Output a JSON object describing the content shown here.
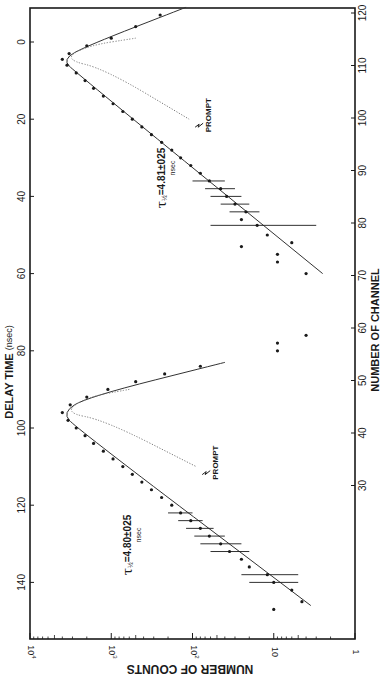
{
  "chart_data": {
    "type": "scatter",
    "orientation": "rotated-90-clockwise",
    "title": "",
    "left_axis": {
      "label": "DELAY TIME",
      "unit": "(nsec)",
      "ticks": [
        0,
        20,
        40,
        60,
        80,
        100,
        120,
        140
      ],
      "range": [
        -9,
        150
      ]
    },
    "right_axis": {
      "label": "NUMBER OF CHANNEL",
      "ticks": [
        30,
        40,
        50,
        60,
        70,
        80,
        90,
        100,
        110,
        120
      ],
      "range": [
        26,
        121
      ]
    },
    "bottom_axis": {
      "label": "NUMBER OF COUNTS",
      "scale": "log",
      "ticks": [
        "10^4",
        "10^3",
        "10^2",
        "10",
        "1"
      ],
      "tick_values": [
        10000,
        1000,
        100,
        10,
        1
      ],
      "range": [
        10000,
        1
      ]
    },
    "grid": false,
    "series": [
      {
        "name": "Spectrum 1 (channels ~80-120)",
        "annotation": "τ½ = 4.81 ± 0.25 nsec",
        "annotation_parts": {
          "symbol": "τ½=",
          "value": "4.81±025",
          "unit": "nsec"
        },
        "peak": {
          "delay_ns": 4.5,
          "counts": 4000
        },
        "points": [
          {
            "delay": -7,
            "counts": 250
          },
          {
            "delay": -4,
            "counts": 500
          },
          {
            "delay": -1,
            "counts": 1000
          },
          {
            "delay": 1,
            "counts": 2000
          },
          {
            "delay": 3,
            "counts": 3300
          },
          {
            "delay": 4.5,
            "counts": 4000
          },
          {
            "delay": 6,
            "counts": 3500
          },
          {
            "delay": 8,
            "counts": 2700
          },
          {
            "delay": 10,
            "counts": 2100
          },
          {
            "delay": 12,
            "counts": 1650
          },
          {
            "delay": 14,
            "counts": 1250
          },
          {
            "delay": 16,
            "counts": 950
          },
          {
            "delay": 18,
            "counts": 720
          },
          {
            "delay": 20,
            "counts": 550
          },
          {
            "delay": 22,
            "counts": 420
          },
          {
            "delay": 24,
            "counts": 320
          },
          {
            "delay": 26,
            "counts": 240
          },
          {
            "delay": 28,
            "counts": 180
          },
          {
            "delay": 30,
            "counts": 140
          },
          {
            "delay": 32,
            "counts": 105
          },
          {
            "delay": 34,
            "counts": 80
          },
          {
            "delay": 36,
            "counts": 62
          },
          {
            "delay": 38,
            "counts": 45
          },
          {
            "delay": 40,
            "counts": 38
          },
          {
            "delay": 42,
            "counts": 30
          },
          {
            "delay": 44,
            "counts": 22
          },
          {
            "delay": 46,
            "counts": 25
          },
          {
            "delay": 47.5,
            "counts": 16
          },
          {
            "delay": 50,
            "counts": 12
          },
          {
            "delay": 52,
            "counts": 6
          },
          {
            "delay": 53,
            "counts": 25
          },
          {
            "delay": 55,
            "counts": 9
          },
          {
            "delay": 57,
            "counts": 9
          },
          {
            "delay": 60,
            "counts": 4
          },
          {
            "delay": 76,
            "counts": 4
          },
          {
            "delay": 78,
            "counts": 9
          },
          {
            "delay": 80,
            "counts": 9
          }
        ],
        "fit_line": [
          {
            "delay": -9,
            "counts": 120
          },
          {
            "delay": 1,
            "counts": 2000
          },
          {
            "delay": 4.5,
            "counts": 4000
          },
          {
            "delay": 8,
            "counts": 2700
          },
          {
            "delay": 60,
            "counts": 2.5
          }
        ],
        "prompt_curve": [
          {
            "delay": -1,
            "counts": 500
          },
          {
            "delay": 1,
            "counts": 2000
          },
          {
            "delay": 4.5,
            "counts": 3800
          },
          {
            "delay": 7,
            "counts": 1200
          },
          {
            "delay": 20,
            "counts": 110
          }
        ],
        "prompt_label": "PROMPT"
      },
      {
        "name": "Spectrum 2 (channels ~27-65)",
        "annotation": "τ½ = 4.80 ± 0.25 nsec",
        "annotation_parts": {
          "symbol": "τ½=",
          "value": "4.80±025",
          "unit": "nsec"
        },
        "peak": {
          "delay_ns": 96,
          "counts": 4000
        },
        "points": [
          {
            "delay": 84,
            "counts": 80
          },
          {
            "delay": 86,
            "counts": 220
          },
          {
            "delay": 88,
            "counts": 500
          },
          {
            "delay": 90,
            "counts": 1100
          },
          {
            "delay": 92,
            "counts": 2000
          },
          {
            "delay": 94,
            "counts": 3200
          },
          {
            "delay": 96,
            "counts": 4000
          },
          {
            "delay": 98,
            "counts": 3400
          },
          {
            "delay": 100,
            "counts": 2700
          },
          {
            "delay": 102,
            "counts": 2100
          },
          {
            "delay": 104,
            "counts": 1650
          },
          {
            "delay": 106,
            "counts": 1250
          },
          {
            "delay": 108,
            "counts": 950
          },
          {
            "delay": 110,
            "counts": 720
          },
          {
            "delay": 112,
            "counts": 550
          },
          {
            "delay": 114,
            "counts": 420
          },
          {
            "delay": 116,
            "counts": 320
          },
          {
            "delay": 118,
            "counts": 240
          },
          {
            "delay": 120,
            "counts": 180
          },
          {
            "delay": 122,
            "counts": 140
          },
          {
            "delay": 124,
            "counts": 105
          },
          {
            "delay": 126,
            "counts": 80
          },
          {
            "delay": 128,
            "counts": 62
          },
          {
            "delay": 130,
            "counts": 45
          },
          {
            "delay": 132,
            "counts": 35
          },
          {
            "delay": 134,
            "counts": 25
          },
          {
            "delay": 136,
            "counts": 20
          },
          {
            "delay": 138,
            "counts": 12
          },
          {
            "delay": 140,
            "counts": 10
          },
          {
            "delay": 142,
            "counts": 6
          },
          {
            "delay": 145,
            "counts": 4.5
          },
          {
            "delay": 147,
            "counts": 10
          }
        ],
        "fit_line": [
          {
            "delay": 83,
            "counts": 40
          },
          {
            "delay": 92,
            "counts": 2000
          },
          {
            "delay": 96,
            "counts": 4000
          },
          {
            "delay": 100,
            "counts": 2700
          },
          {
            "delay": 146,
            "counts": 3.5
          }
        ],
        "prompt_curve": [
          {
            "delay": 90,
            "counts": 600
          },
          {
            "delay": 92,
            "counts": 2000
          },
          {
            "delay": 96,
            "counts": 3800
          },
          {
            "delay": 98,
            "counts": 1200
          },
          {
            "delay": 110,
            "counts": 90
          }
        ],
        "prompt_label": "PROMPT"
      }
    ],
    "error_bars": [
      {
        "delay": 36,
        "counts": 62,
        "lo": 40,
        "hi": 100
      },
      {
        "delay": 38,
        "counts": 45,
        "lo": 30,
        "hi": 70
      },
      {
        "delay": 40,
        "counts": 38,
        "lo": 25,
        "hi": 60
      },
      {
        "delay": 42,
        "counts": 30,
        "lo": 20,
        "hi": 45
      },
      {
        "delay": 44,
        "counts": 22,
        "lo": 15,
        "hi": 35
      },
      {
        "delay": 47.5,
        "counts": 16,
        "lo": 3,
        "hi": 60
      },
      {
        "delay": 122,
        "counts": 140,
        "lo": 100,
        "hi": 200
      },
      {
        "delay": 124,
        "counts": 105,
        "lo": 75,
        "hi": 150
      },
      {
        "delay": 126,
        "counts": 80,
        "lo": 55,
        "hi": 120
      },
      {
        "delay": 128,
        "counts": 62,
        "lo": 40,
        "hi": 95
      },
      {
        "delay": 130,
        "counts": 45,
        "lo": 25,
        "hi": 80
      },
      {
        "delay": 132,
        "counts": 35,
        "lo": 20,
        "hi": 60
      },
      {
        "delay": 138,
        "counts": 12,
        "lo": 5,
        "hi": 25
      },
      {
        "delay": 140,
        "counts": 10,
        "lo": 5,
        "hi": 20
      }
    ]
  },
  "labels": {
    "delay_axis_title": "DELAY TIME",
    "delay_axis_unit": "(nsec)",
    "channel_axis_title": "NUMBER OF CHANNEL",
    "counts_axis_title": "NUMBER OF COUNTS"
  },
  "layout": {
    "plot_left": 30,
    "plot_top": 8,
    "plot_right": 355,
    "plot_bottom": 639,
    "delay_zero_y": 42,
    "px_per_ns": 3.86,
    "counts_top_x": 30,
    "px_per_decade": 81.25,
    "channel_120_y": 13,
    "px_per_channel": 5.25,
    "ink": "#1a1a1a"
  }
}
